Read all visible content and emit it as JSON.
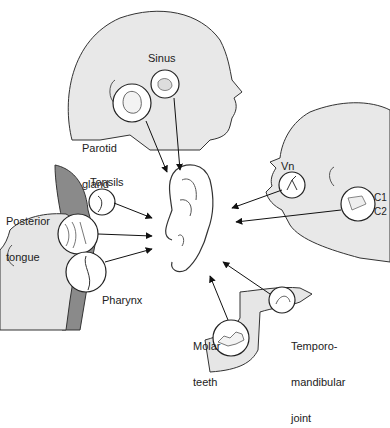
{
  "diagram": {
    "center": "ear",
    "sources": [
      {
        "id": "parotid",
        "label_lines": [
          "Parotid",
          "gland"
        ]
      },
      {
        "id": "sinus",
        "label_lines": [
          "Sinus"
        ]
      },
      {
        "id": "vn",
        "label_lines": [
          "Vn"
        ]
      },
      {
        "id": "c1",
        "label_lines": [
          "C1"
        ]
      },
      {
        "id": "c2",
        "label_lines": [
          "C2"
        ]
      },
      {
        "id": "tonsils",
        "label_lines": [
          "Tonsils"
        ]
      },
      {
        "id": "posterior-tongue",
        "label_lines": [
          "Posterior",
          "tongue"
        ]
      },
      {
        "id": "pharynx",
        "label_lines": [
          "Pharynx"
        ]
      },
      {
        "id": "molar-teeth",
        "label_lines": [
          "Molar",
          "teeth"
        ]
      },
      {
        "id": "tmj",
        "label_lines": [
          "Temporo-",
          "mandibular",
          "joint"
        ]
      }
    ],
    "colors": {
      "line": "#222222",
      "fill_skin": "#e6e6e6",
      "fill_dark": "#8a8a8a",
      "background": "#ffffff"
    }
  }
}
